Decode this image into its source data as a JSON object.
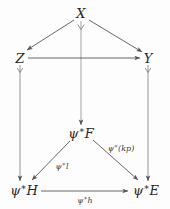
{
  "diagram": {
    "background_color": "#fdfdfd",
    "stroke_color": "#555555",
    "text_color": "#2a2a2a",
    "nodes": [
      {
        "id": "X",
        "label": "X",
        "psi_prefix": false,
        "x": 81,
        "y": 13
      },
      {
        "id": "Z",
        "label": "Z",
        "psi_prefix": false,
        "x": 20,
        "y": 58
      },
      {
        "id": "Y",
        "label": "Y",
        "psi_prefix": false,
        "x": 148,
        "y": 58
      },
      {
        "id": "psiF",
        "label": "F",
        "psi_prefix": true,
        "x": 81,
        "y": 133
      },
      {
        "id": "psiH",
        "label": "H",
        "psi_prefix": true,
        "x": 24,
        "y": 190
      },
      {
        "id": "psiE",
        "label": "E",
        "psi_prefix": true,
        "x": 146,
        "y": 190
      }
    ],
    "edges": [
      {
        "id": "X-to-Z",
        "from": "X",
        "to": "Z",
        "label": "",
        "psi_prefix": false
      },
      {
        "id": "X-to-Y",
        "from": "X",
        "to": "Y",
        "label": "",
        "psi_prefix": false
      },
      {
        "id": "X-to-psiF",
        "from": "X",
        "to": "psiF",
        "label": "",
        "psi_prefix": false
      },
      {
        "id": "Z-to-Y",
        "from": "Z",
        "to": "Y",
        "label": "",
        "psi_prefix": false
      },
      {
        "id": "Z-to-psiH",
        "from": "Z",
        "to": "psiH",
        "label": "",
        "psi_prefix": false
      },
      {
        "id": "Y-to-psiE",
        "from": "Y",
        "to": "psiE",
        "label": "",
        "psi_prefix": false
      },
      {
        "id": "psiF-to-psiH",
        "from": "psiF",
        "to": "psiH",
        "label": "l",
        "psi_prefix": true,
        "label_x": 62,
        "label_y": 166
      },
      {
        "id": "psiF-to-psiE",
        "from": "psiF",
        "to": "psiE",
        "label": "(kp)",
        "psi_prefix": true,
        "label_x": 121,
        "label_y": 148
      },
      {
        "id": "psiH-to-psiE",
        "from": "psiH",
        "to": "psiE",
        "label": "h",
        "psi_prefix": true,
        "label_x": 85,
        "label_y": 200
      }
    ],
    "symbols": {
      "psi": "ψ",
      "star": "∗"
    }
  }
}
